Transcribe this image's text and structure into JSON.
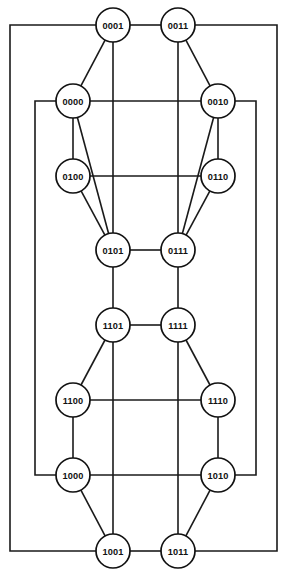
{
  "diagram": {
    "type": "graph",
    "width": 287,
    "height": 575,
    "stroke_color": "#1a1a1a",
    "node_fill": "#ffffff",
    "node_stroke": "#111111",
    "background": "#ffffff",
    "node_radius": 17,
    "nodes": [
      {
        "id": "0001",
        "label": "0001",
        "x": 113,
        "y": 25
      },
      {
        "id": "0011",
        "label": "0011",
        "x": 178,
        "y": 25
      },
      {
        "id": "0000",
        "label": "0000",
        "x": 73,
        "y": 101
      },
      {
        "id": "0010",
        "label": "0010",
        "x": 218,
        "y": 101
      },
      {
        "id": "0100",
        "label": "0100",
        "x": 73,
        "y": 176
      },
      {
        "id": "0110",
        "label": "0110",
        "x": 218,
        "y": 176
      },
      {
        "id": "0101",
        "label": "0101",
        "x": 113,
        "y": 250
      },
      {
        "id": "0111",
        "label": "0111",
        "x": 178,
        "y": 250
      },
      {
        "id": "1101",
        "label": "1101",
        "x": 113,
        "y": 325
      },
      {
        "id": "1111",
        "label": "1111",
        "x": 178,
        "y": 325
      },
      {
        "id": "1100",
        "label": "1100",
        "x": 73,
        "y": 400
      },
      {
        "id": "1110",
        "label": "1110",
        "x": 218,
        "y": 400
      },
      {
        "id": "1000",
        "label": "1000",
        "x": 73,
        "y": 475
      },
      {
        "id": "1010",
        "label": "1010",
        "x": 218,
        "y": 475
      },
      {
        "id": "1001",
        "label": "1001",
        "x": 113,
        "y": 551
      },
      {
        "id": "1011",
        "label": "1011",
        "x": 178,
        "y": 551
      }
    ],
    "straight_edges": [
      {
        "from": "0001",
        "to": "0011"
      },
      {
        "from": "0001",
        "to": "0000"
      },
      {
        "from": "0001",
        "to": "0101"
      },
      {
        "from": "0011",
        "to": "0010"
      },
      {
        "from": "0011",
        "to": "0111"
      },
      {
        "from": "0000",
        "to": "0010"
      },
      {
        "from": "0000",
        "to": "0100"
      },
      {
        "from": "0000",
        "to": "0101"
      },
      {
        "from": "0010",
        "to": "0110"
      },
      {
        "from": "0010",
        "to": "0111"
      },
      {
        "from": "0100",
        "to": "0110"
      },
      {
        "from": "0100",
        "to": "0101"
      },
      {
        "from": "0110",
        "to": "0111"
      },
      {
        "from": "0101",
        "to": "0111"
      },
      {
        "from": "0101",
        "to": "1101"
      },
      {
        "from": "0111",
        "to": "1111"
      },
      {
        "from": "1101",
        "to": "1111"
      },
      {
        "from": "1101",
        "to": "1100"
      },
      {
        "from": "1101",
        "to": "1001"
      },
      {
        "from": "1111",
        "to": "1110"
      },
      {
        "from": "1111",
        "to": "1011"
      },
      {
        "from": "1100",
        "to": "1110"
      },
      {
        "from": "1100",
        "to": "1000"
      },
      {
        "from": "1110",
        "to": "1010"
      },
      {
        "from": "1000",
        "to": "1010"
      },
      {
        "from": "1000",
        "to": "1001"
      },
      {
        "from": "1010",
        "to": "1011"
      },
      {
        "from": "1001",
        "to": "1011"
      }
    ],
    "wrap_edges": [
      {
        "name": "outer-wrap-0001-0011",
        "points": [
          [
            113,
            25
          ],
          [
            10,
            25
          ],
          [
            10,
            551
          ],
          [
            113,
            551
          ]
        ],
        "from": "0001",
        "to": "1001"
      },
      {
        "name": "outer-wrap-0011-1011",
        "points": [
          [
            178,
            25
          ],
          [
            277,
            25
          ],
          [
            277,
            551
          ],
          [
            178,
            551
          ]
        ],
        "from": "0011",
        "to": "1011"
      },
      {
        "name": "inner-wrap-0000-1000",
        "points": [
          [
            73,
            101
          ],
          [
            35,
            101
          ],
          [
            35,
            475
          ],
          [
            73,
            475
          ]
        ],
        "from": "0000",
        "to": "1000"
      },
      {
        "name": "inner-wrap-0010-1010",
        "points": [
          [
            218,
            101
          ],
          [
            256,
            101
          ],
          [
            256,
            475
          ],
          [
            218,
            475
          ]
        ],
        "from": "0010",
        "to": "1010"
      }
    ]
  }
}
